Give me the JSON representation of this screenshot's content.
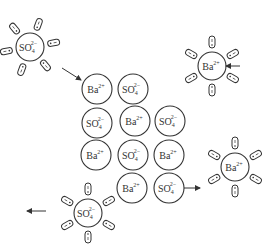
{
  "diagram": {
    "colors": {
      "stroke": "#333333",
      "text": "#333333",
      "background": "#ffffff"
    },
    "ion_radius": 15,
    "lattice": [
      {
        "ion": "Ba",
        "charge": "2+",
        "x": 97,
        "y": 89
      },
      {
        "ion": "SO",
        "sub": "4",
        "charge": "2−",
        "x": 133,
        "y": 89
      },
      {
        "ion": "SO",
        "sub": "4",
        "charge": "2−",
        "x": 97,
        "y": 123
      },
      {
        "ion": "Ba",
        "charge": "2+",
        "x": 135,
        "y": 121
      },
      {
        "ion": "SO",
        "sub": "4",
        "charge": "2−",
        "x": 170,
        "y": 121
      },
      {
        "ion": "Ba",
        "charge": "2+",
        "x": 96,
        "y": 155
      },
      {
        "ion": "SO",
        "sub": "4",
        "charge": "2−",
        "x": 133,
        "y": 155
      },
      {
        "ion": "Ba",
        "charge": "2+",
        "x": 169,
        "y": 155
      },
      {
        "ion": "Ba",
        "charge": "2+",
        "x": 132,
        "y": 188
      },
      {
        "ion": "SO",
        "sub": "4",
        "charge": "2−",
        "x": 169,
        "y": 188
      }
    ],
    "hydrated_ions": [
      {
        "ion": "SO",
        "sub": "4",
        "charge": "2−",
        "x": 30,
        "y": 47,
        "water_count": 6,
        "start_angle": -70
      },
      {
        "ion": "Ba",
        "charge": "2+",
        "x": 212,
        "y": 66,
        "water_count": 6,
        "start_angle": -90
      },
      {
        "ion": "Ba",
        "charge": "2+",
        "x": 235,
        "y": 167,
        "water_count": 6,
        "start_angle": -90
      },
      {
        "ion": "SO",
        "sub": "4",
        "charge": "2−",
        "x": 88,
        "y": 213,
        "water_count": 6,
        "start_angle": -90
      }
    ],
    "arrows": [
      {
        "name": "arrow-sulfate-to-lattice",
        "x1": 62,
        "y1": 68,
        "x2": 81,
        "y2": 80
      },
      {
        "name": "arrow-barium-approaching",
        "x1": 240,
        "y1": 66,
        "x2": 226,
        "y2": 66
      },
      {
        "name": "arrow-lattice-to-barium",
        "x1": 184,
        "y1": 188,
        "x2": 200,
        "y2": 188
      },
      {
        "name": "arrow-sulfate-leaving",
        "x1": 46,
        "y1": 211,
        "x2": 27,
        "y2": 211
      }
    ]
  }
}
